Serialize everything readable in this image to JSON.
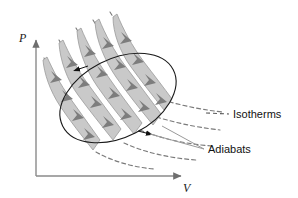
{
  "figure": {
    "kind": "pv-diagram",
    "background_color": "#ffffff",
    "title": "",
    "axes": {
      "y_label": "P",
      "x_label": "V",
      "axis_color": "#808080",
      "origin": {
        "x": 36,
        "y": 176
      },
      "y_axis_top": {
        "x": 36,
        "y": 38
      },
      "x_axis_right": {
        "x": 184,
        "y": 176
      }
    },
    "annotations": [
      {
        "name": "isotherms",
        "label": "Isotherms",
        "x": 233,
        "y": 118,
        "leader_from": {
          "x": 228,
          "y": 114
        },
        "leader_to": {
          "x": 206,
          "y": 113
        },
        "leader_style": "dashed",
        "leader_color": "#5a5a5a"
      },
      {
        "name": "adiabats",
        "label": "Adiabats",
        "x": 208,
        "y": 153,
        "leader_from": {
          "x": 204,
          "y": 149
        },
        "leader_to": {
          "x": 150,
          "y": 134
        },
        "leader_style": "solid",
        "leader_color": "#9a9a9a"
      }
    ],
    "cycle_ellipse": {
      "center": {
        "x": 118,
        "y": 98
      },
      "radius_x": 62,
      "radius_y": 39,
      "rotation_deg": -27,
      "stroke": "#1a1a1a",
      "stroke_width": 1.1,
      "fill": "none",
      "direction": "counterclockwise",
      "direction_markers": [
        {
          "x": 79,
          "y": 70,
          "angle_deg": 188
        },
        {
          "x": 148,
          "y": 133,
          "angle_deg": 14
        }
      ]
    },
    "flow_ribbons": {
      "fill": "#c9c9c9",
      "stroke": "#8f8f8f",
      "arrow_color": "#7d7d7d",
      "direction": "down-right",
      "count": 5,
      "description": "Shaded arrow bands running from upper-left tips down toward lower-right, each carrying a chain of chevron arrowheads"
    },
    "dashed_curves": {
      "adiabat_color": "#7a7a7a",
      "isotherm_color": "#7a7a7a",
      "dash_pattern": "4 3",
      "adiabat_count": 5,
      "isotherm_count": 4
    }
  }
}
